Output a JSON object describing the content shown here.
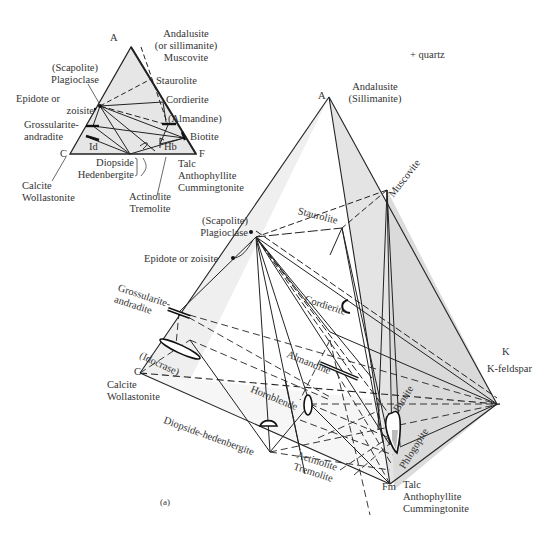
{
  "figure": {
    "panel_label": "(a)",
    "note": "+ quartz"
  },
  "small_triangle": {
    "vertices": {
      "A": {
        "label": "A",
        "minerals": [
          "Andalusite",
          "(or sillimanite)",
          "Muscovite"
        ]
      },
      "C": {
        "label": "C",
        "minerals": [
          "Calcite",
          "Wollastonite"
        ]
      },
      "F": {
        "label": "F",
        "minerals": [
          "Talc",
          "Anthophyllite",
          "Cummingtonite"
        ]
      }
    },
    "phases": {
      "plagioclase": [
        "(Scapolite)",
        "Plagioclase"
      ],
      "epidote": [
        "Epidote or",
        "zoisite"
      ],
      "staurolite": "Staurolite",
      "cordierite": "Cordierite",
      "almandine": "(Almandine)",
      "biotite": "Biotite",
      "grossularite": [
        "Grossularite-",
        "andradite"
      ],
      "idocrase": "Id",
      "hornblende": "Hb",
      "diopside": [
        "Diopside",
        "Hedenbergite"
      ],
      "actinolite": [
        "Actinolite",
        "Tremolite"
      ]
    }
  },
  "tetrahedron": {
    "vertices": {
      "A": {
        "label": "A",
        "minerals": [
          "Andalusite",
          "(Sillimanite)"
        ]
      },
      "C": {
        "label": "C",
        "minerals": [
          "Calcite",
          "Wollastonite"
        ]
      },
      "K": {
        "label": "K",
        "minerals": [
          "K-feldspar"
        ]
      },
      "Fm": {
        "label": "Fm",
        "minerals": [
          "Talc",
          "Anthophyllite",
          "Cummingtonite"
        ]
      }
    },
    "phases": {
      "muscovite": "Muscovite",
      "staurolite": "Staurolite",
      "plagioclase": [
        "(Scapolite)",
        "Plagioclase"
      ],
      "epidote": "Epidote or zoisite",
      "cordierite": "Cordierite",
      "grossularite": [
        "Grossularite-",
        "andradite"
      ],
      "idocrase": "(Idocrase)",
      "almandine": "Almandine",
      "hornblende": "Hornblende",
      "diopside": "Diopside-hedenbergite",
      "actinolite": [
        "Actinolite",
        "Tremolite"
      ],
      "biotite": "Biotite",
      "phlogopite": "Phlogopite"
    }
  }
}
